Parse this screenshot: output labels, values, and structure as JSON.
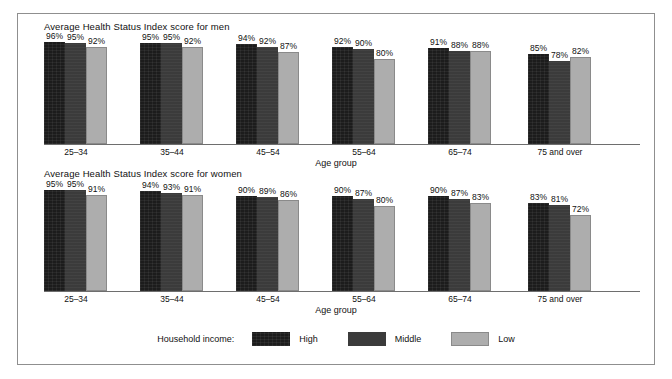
{
  "chart_data": {
    "type": "bar",
    "title": "",
    "xlabel": "Age group",
    "ylabel": "",
    "ylim": [
      0,
      100
    ],
    "grid": false,
    "legend_position": "bottom",
    "legend_title": "Household income:",
    "categories": [
      "25–34",
      "35–44",
      "45–54",
      "55–64",
      "65–74",
      "75 and over"
    ],
    "panels": [
      {
        "title": "Average Health Status Index score for men",
        "xlabel": "Age group",
        "series": [
          {
            "name": "High",
            "color": "#1c1c1c",
            "values": [
              96,
              95,
              94,
              92,
              91,
              85
            ],
            "labels": [
              "96%",
              "95%",
              "94%",
              "92%",
              "91%",
              "85%"
            ]
          },
          {
            "name": "Middle",
            "color": "#3b3b3b",
            "values": [
              95,
              95,
              92,
              90,
              88,
              78
            ],
            "labels": [
              "95%",
              "95%",
              "92%",
              "90%",
              "88%",
              "78%"
            ]
          },
          {
            "name": "Low",
            "color": "#adadad",
            "values": [
              92,
              92,
              87,
              80,
              88,
              82
            ],
            "labels": [
              "92%",
              "92%",
              "87%",
              "80%",
              "88%",
              "82%"
            ]
          }
        ]
      },
      {
        "title": "Average Health Status Index score for women",
        "xlabel": "Age group",
        "series": [
          {
            "name": "High",
            "color": "#1c1c1c",
            "values": [
              95,
              94,
              90,
              90,
              90,
              83
            ],
            "labels": [
              "95%",
              "94%",
              "90%",
              "90%",
              "90%",
              "83%"
            ]
          },
          {
            "name": "Middle",
            "color": "#3b3b3b",
            "values": [
              95,
              93,
              89,
              87,
              87,
              81
            ],
            "labels": [
              "95%",
              "93%",
              "89%",
              "87%",
              "87%",
              "81%"
            ]
          },
          {
            "name": "Low",
            "color": "#adadad",
            "values": [
              91,
              91,
              86,
              80,
              83,
              72
            ],
            "labels": [
              "91%",
              "91%",
              "86%",
              "80%",
              "83%",
              "72%"
            ]
          }
        ]
      }
    ],
    "legend": [
      {
        "label": "High",
        "color": "#1c1c1c"
      },
      {
        "label": "Middle",
        "color": "#3b3b3b"
      },
      {
        "label": "Low",
        "color": "#adadad"
      }
    ]
  }
}
